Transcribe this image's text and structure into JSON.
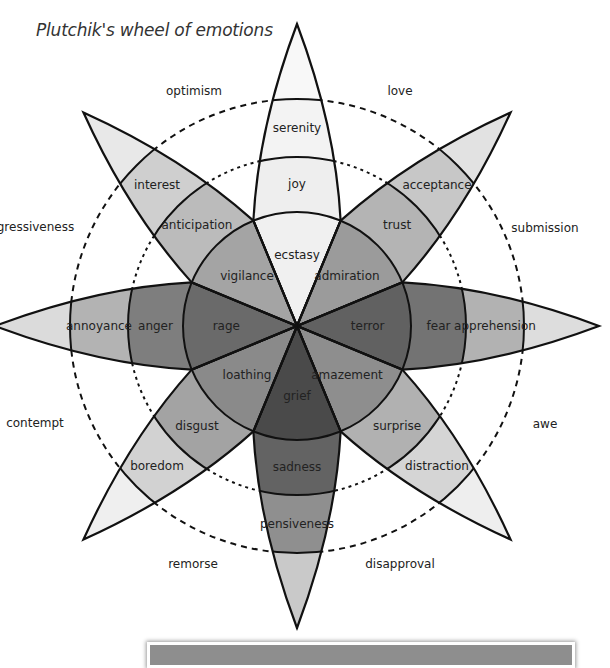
{
  "title": "Plutchik's wheel of emotions",
  "wheel": {
    "center": [
      297,
      326
    ],
    "radii": {
      "inner": 114,
      "middle": 169,
      "outer": 227,
      "tip": 302
    },
    "dashed_circles": [
      169,
      227
    ],
    "petals": [
      {
        "id": "joy",
        "angle": -90,
        "labels": [
          "ecstasy",
          "joy",
          "serenity"
        ],
        "colors": [
          "#f0f0f0",
          "#eeeeee",
          "#f3f3f3",
          "#f8f8f8"
        ]
      },
      {
        "id": "trust",
        "angle": -45,
        "labels": [
          "admiration",
          "trust",
          "acceptance"
        ],
        "colors": [
          "#9b9b9b",
          "#b4b4b4",
          "#c7c7c7",
          "#e2e2e2"
        ]
      },
      {
        "id": "fear",
        "angle": 0,
        "labels": [
          "terror",
          "fear",
          "apprehension"
        ],
        "colors": [
          "#616161",
          "#737373",
          "#b2b2b2",
          "#dddddd"
        ]
      },
      {
        "id": "surprise",
        "angle": 45,
        "labels": [
          "amazement",
          "surprise",
          "distraction"
        ],
        "colors": [
          "#8e8e8e",
          "#b1b1b1",
          "#d5d5d5",
          "#eeeeee"
        ]
      },
      {
        "id": "sadness",
        "angle": 90,
        "labels": [
          "grief",
          "sadness",
          "pensiveness"
        ],
        "colors": [
          "#4a4a4a",
          "#636363",
          "#8f8f8f",
          "#c9c9c9"
        ]
      },
      {
        "id": "disgust",
        "angle": 135,
        "labels": [
          "loathing",
          "disgust",
          "boredom"
        ],
        "colors": [
          "#8a8a8a",
          "#a3a3a3",
          "#d2d2d2",
          "#efefef"
        ]
      },
      {
        "id": "anger",
        "angle": 180,
        "labels": [
          "rage",
          "anger",
          "annoyance"
        ],
        "colors": [
          "#6a6a6a",
          "#7e7e7e",
          "#b3b3b3",
          "#dbdbdb"
        ]
      },
      {
        "id": "anticipation",
        "angle": -135,
        "labels": [
          "vigilance",
          "anticipation",
          "interest"
        ],
        "colors": [
          "#a4a4a4",
          "#bbbbbb",
          "#cfcfcf",
          "#e8e8e8"
        ]
      }
    ],
    "dyads": [
      {
        "label": "love",
        "x": 400,
        "y": 91
      },
      {
        "label": "submission",
        "x": 545,
        "y": 228
      },
      {
        "label": "awe",
        "x": 545,
        "y": 424
      },
      {
        "label": "disapproval",
        "x": 400,
        "y": 564
      },
      {
        "label": "remorse",
        "x": 193,
        "y": 564
      },
      {
        "label": "contempt",
        "x": 35,
        "y": 423
      },
      {
        "label": "aggressiveness",
        "x": 28,
        "y": 227
      },
      {
        "label": "optimism",
        "x": 194,
        "y": 91
      }
    ]
  }
}
